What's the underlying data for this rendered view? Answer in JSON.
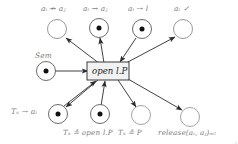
{
  "figure": {
    "type": "petri-net",
    "background_color": "#ffffff",
    "place_stroke": "#8c8c8c",
    "token_color": "#111111",
    "arc_color": "#2b2b2b",
    "transition_fill": "#f2f2f2",
    "transition_stroke": "#3a3a3a",
    "label_color": "#7e7e7e",
    "corner_mark": ","
  },
  "transition": {
    "name": "open-transition",
    "label": "open l.P",
    "x": 108,
    "y": 71
  },
  "places": {
    "top": [
      {
        "id": "p-top-1",
        "label": "a_i ↛ a_j",
        "label_text": "a",
        "tokens": 0,
        "cx": 57,
        "cy": 29
      },
      {
        "id": "p-top-2",
        "label": "a_i → a_j",
        "tokens": 1,
        "cx": 99,
        "cy": 28
      },
      {
        "id": "p-top-3",
        "label": "a_i ⇢ l",
        "tokens": 1,
        "cx": 142,
        "cy": 29
      },
      {
        "id": "p-top-4",
        "label": "a_i ✓",
        "tokens": 0,
        "cx": 183,
        "cy": 29
      }
    ],
    "left": [
      {
        "id": "p-sem",
        "label": "Sem",
        "tokens": 1,
        "cx": 46,
        "cy": 71
      }
    ],
    "bottom": [
      {
        "id": "p-bot-1",
        "label": "T_s → a_i",
        "tokens": 1,
        "cx": 58,
        "cy": 114
      },
      {
        "id": "p-bot-2",
        "label": "",
        "tokens": 1,
        "cx": 100,
        "cy": 114
      },
      {
        "id": "p-bot-3",
        "label": "",
        "tokens": 0,
        "cx": 141,
        "cy": 115
      },
      {
        "id": "p-bot-4",
        "label": "",
        "tokens": 0,
        "cx": 190,
        "cy": 117
      }
    ]
  },
  "labels": {
    "top_1": "aᵢ ↛ aⱼ",
    "top_2": "aᵢ → aⱼ",
    "top_3": "aᵢ ⇢ l",
    "top_4": "aᵢ ✓",
    "sem": "Sem",
    "bottom_left": "Tₛ → aᵢ",
    "caption_1": "Tₛ ≙ open l.P",
    "caption_2": "Tₛ ≙ P",
    "caption_3": "release(aᵢ, aⱼ)ₘₗ"
  }
}
